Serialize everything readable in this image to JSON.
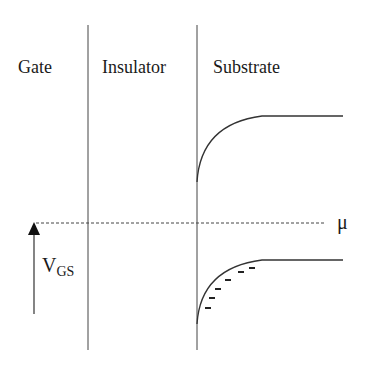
{
  "diagram": {
    "regions": [
      {
        "label": "Gate",
        "x": 18
      },
      {
        "label": "Insulator",
        "x": 102
      },
      {
        "label": "Substrate",
        "x": 213
      }
    ],
    "chemical_potential_label": "μ",
    "voltage_label": {
      "main": "V",
      "subscript": "GS"
    },
    "colors": {
      "line": "#333333",
      "text": "#1a1a1a",
      "background": "#ffffff"
    },
    "electron_charge_symbol": "-",
    "electron_count": 6
  }
}
